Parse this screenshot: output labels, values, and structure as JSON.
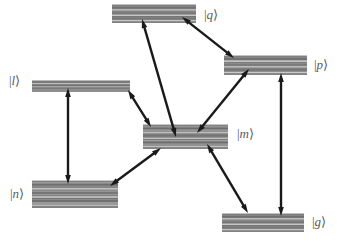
{
  "figure": {
    "type": "energy-level-diagram",
    "background_color": "#ffffff",
    "level_fill_dark": "#6f6f6f",
    "level_fill_light": "#c9c9c9",
    "arrow_color": "#1a1a1a",
    "label_color": "#5a5a5a",
    "width": 338,
    "height": 241
  },
  "levels": [
    {
      "id": "q",
      "label": "|q⟩",
      "label_text": "q",
      "x": 112,
      "y": 4,
      "width": 84,
      "height": 19,
      "label_x": 204,
      "label_y": 8,
      "label_side": "right",
      "bands": 7
    },
    {
      "id": "p",
      "label": "|p⟩",
      "label_text": "p",
      "x": 224,
      "y": 55,
      "width": 83,
      "height": 20,
      "label_x": 314,
      "label_y": 58,
      "label_side": "right",
      "bands": 7
    },
    {
      "id": "l",
      "label": "|l⟩",
      "label_text": "l",
      "x": 32,
      "y": 80,
      "width": 98,
      "height": 12,
      "label_x": 9,
      "label_y": 74,
      "label_side": "left",
      "bands": 4
    },
    {
      "id": "m",
      "label": "|m⟩",
      "label_text": "m",
      "x": 143,
      "y": 124,
      "width": 85,
      "height": 25,
      "label_x": 237,
      "label_y": 127,
      "label_side": "right",
      "bands": 9
    },
    {
      "id": "n",
      "label": "|n⟩",
      "label_text": "n",
      "x": 32,
      "y": 180,
      "width": 86,
      "height": 28,
      "label_x": 10,
      "label_y": 187,
      "label_side": "left",
      "bands": 10
    },
    {
      "id": "g",
      "label": "|g⟩",
      "label_text": "g",
      "x": 222,
      "y": 213,
      "width": 82,
      "height": 19,
      "label_x": 312,
      "label_y": 215,
      "label_side": "right",
      "bands": 7
    }
  ],
  "transitions": [
    {
      "id": "l-n",
      "from": "l",
      "to": "n",
      "x1": 68,
      "y1": 88,
      "x2": 68,
      "y2": 184,
      "double_headed": true
    },
    {
      "id": "l-m",
      "from": "l",
      "to": "m",
      "x1": 128,
      "y1": 90,
      "x2": 151,
      "y2": 127,
      "double_headed": true
    },
    {
      "id": "n-m",
      "from": "n",
      "to": "m",
      "x1": 110,
      "y1": 186,
      "x2": 161,
      "y2": 148,
      "double_headed": true
    },
    {
      "id": "m-q",
      "from": "m",
      "to": "q",
      "x1": 176,
      "y1": 137,
      "x2": 142,
      "y2": 19,
      "double_headed": true
    },
    {
      "id": "q-p",
      "from": "q",
      "to": "p",
      "x1": 182,
      "y1": 17,
      "x2": 234,
      "y2": 58,
      "double_headed": true
    },
    {
      "id": "m-p",
      "from": "m",
      "to": "p",
      "x1": 197,
      "y1": 133,
      "x2": 249,
      "y2": 69,
      "double_headed": true
    },
    {
      "id": "m-g",
      "from": "m",
      "to": "g",
      "x1": 207,
      "y1": 144,
      "x2": 248,
      "y2": 213,
      "double_headed": true
    },
    {
      "id": "p-g",
      "from": "p",
      "to": "g",
      "x1": 281,
      "y1": 73,
      "x2": 281,
      "y2": 216,
      "double_headed": true
    }
  ]
}
